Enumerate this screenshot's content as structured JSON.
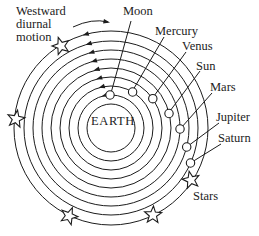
{
  "figure": {
    "annotation": {
      "line1": "Westward",
      "line2": "diurnal",
      "line3": "motion"
    },
    "center_label": "EARTH",
    "bodies": [
      {
        "name": "Moon"
      },
      {
        "name": "Mercury"
      },
      {
        "name": "Venus"
      },
      {
        "name": "Sun"
      },
      {
        "name": "Mars"
      },
      {
        "name": "Jupiter"
      },
      {
        "name": "Saturn"
      }
    ],
    "outer_sphere_label": "Stars",
    "orbit_count": 8,
    "star_marker_count": 5
  },
  "colors": {
    "ink": "#1c1c1c",
    "background": "#ffffff"
  }
}
